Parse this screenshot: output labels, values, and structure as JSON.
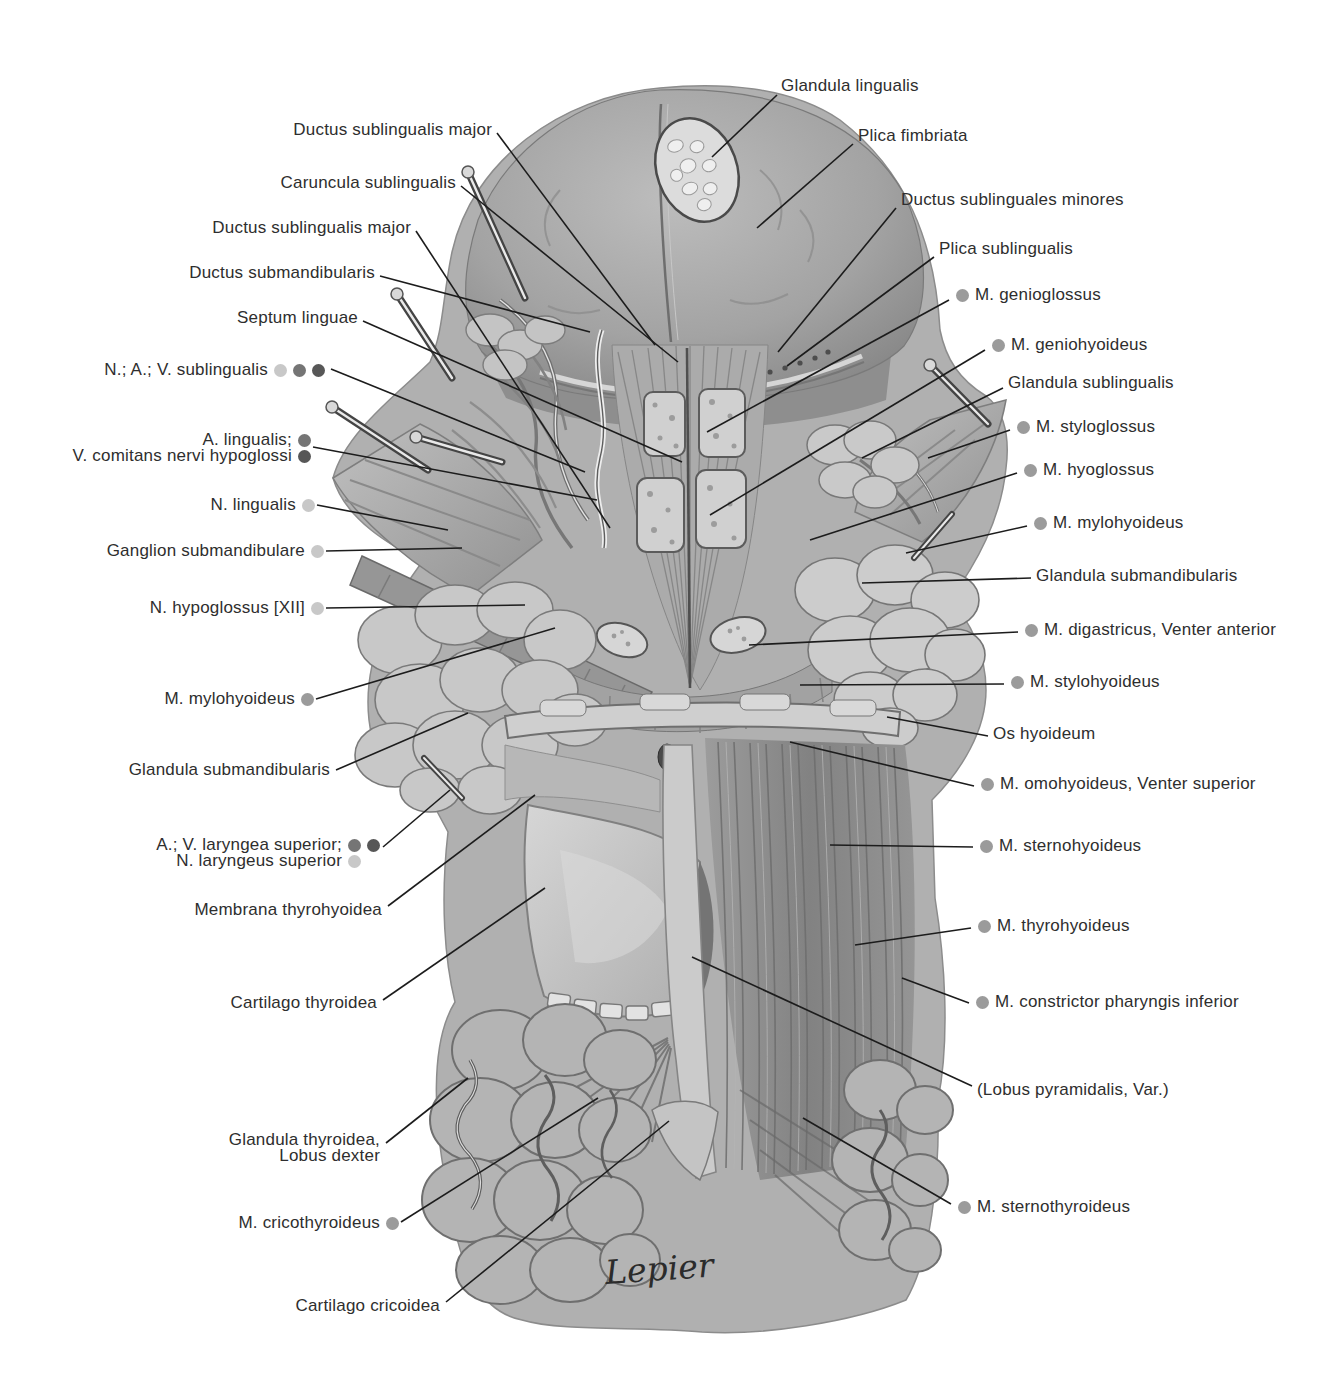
{
  "figure": {
    "signature": "Lepier",
    "colors": {
      "background": "#ffffff",
      "label_text": "#2e2e2e",
      "leader_line": "#1c1c1c",
      "nerve_dot": "#c8c8c8",
      "artery_dot": "#757575",
      "vein_dot": "#575757",
      "muscle_dot": "#9b9b9b"
    }
  },
  "labels": {
    "left": [
      {
        "text": "Ductus sublingualis major",
        "dots": []
      },
      {
        "text": "Caruncula sublingualis",
        "dots": []
      },
      {
        "text": "Ductus sublingualis major",
        "dots": []
      },
      {
        "text": "Ductus submandibularis",
        "dots": []
      },
      {
        "text": "Septum linguae",
        "dots": []
      },
      {
        "text": "N.; A.; V. sublingualis",
        "dots": [
          "nerve",
          "artery",
          "vein"
        ]
      },
      {
        "text": "A. lingualis;",
        "dots": [
          "artery"
        ]
      },
      {
        "text": "V. comitans nervi hypoglossi",
        "dots": [
          "vein"
        ]
      },
      {
        "text": "N. lingualis",
        "dots": [
          "nerve"
        ]
      },
      {
        "text": "Ganglion submandibulare",
        "dots": [
          "nerve"
        ]
      },
      {
        "text": "N. hypoglossus [XII]",
        "dots": [
          "nerve"
        ]
      },
      {
        "text": "M. mylohyoideus",
        "dots": [
          "muscle"
        ]
      },
      {
        "text": "Glandula submandibularis",
        "dots": []
      },
      {
        "text": "A.; V. laryngea superior;",
        "dots": [
          "artery",
          "vein"
        ]
      },
      {
        "text": "N. laryngeus superior",
        "dots": [
          "nerve"
        ]
      },
      {
        "text": "Membrana thyrohyoidea",
        "dots": []
      },
      {
        "text": "Cartilago thyroidea",
        "dots": []
      },
      {
        "text": "Glandula thyroidea,",
        "dots": []
      },
      {
        "text": "Lobus dexter",
        "dots": []
      },
      {
        "text": "M. cricothyroideus",
        "dots": [
          "muscle"
        ]
      },
      {
        "text": "Cartilago cricoidea",
        "dots": []
      }
    ],
    "right": [
      {
        "text": "Glandula lingualis",
        "dots": []
      },
      {
        "text": "Plica fimbriata",
        "dots": []
      },
      {
        "text": "Ductus sublinguales minores",
        "dots": []
      },
      {
        "text": "Plica sublingualis",
        "dots": []
      },
      {
        "text": "M. genioglossus",
        "dots": [
          "muscle"
        ]
      },
      {
        "text": "M. geniohyoideus",
        "dots": [
          "muscle"
        ]
      },
      {
        "text": "Glandula sublingualis",
        "dots": []
      },
      {
        "text": "M. styloglossus",
        "dots": [
          "muscle"
        ]
      },
      {
        "text": "M. hyoglossus",
        "dots": [
          "muscle"
        ]
      },
      {
        "text": "M. mylohyoideus",
        "dots": [
          "muscle"
        ]
      },
      {
        "text": "Glandula submandibularis",
        "dots": []
      },
      {
        "text": "M. digastricus, Venter anterior",
        "dots": [
          "muscle"
        ]
      },
      {
        "text": "M. stylohyoideus",
        "dots": [
          "muscle"
        ]
      },
      {
        "text": "Os hyoideum",
        "dots": []
      },
      {
        "text": "M. omohyoideus, Venter superior",
        "dots": [
          "muscle"
        ]
      },
      {
        "text": "M. sternohyoideus",
        "dots": [
          "muscle"
        ]
      },
      {
        "text": "M. thyrohyoideus",
        "dots": [
          "muscle"
        ]
      },
      {
        "text": "M. constrictor pharyngis inferior",
        "dots": [
          "muscle"
        ]
      },
      {
        "text": "(Lobus pyramidalis, Var.)",
        "dots": []
      },
      {
        "text": "M. sternothyroideus",
        "dots": [
          "muscle"
        ]
      }
    ]
  }
}
